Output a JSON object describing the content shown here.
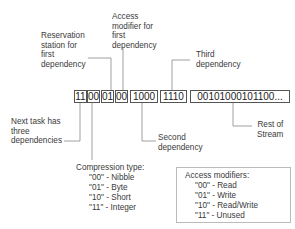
{
  "bitstream": {
    "segments": [
      {
        "bits": "11",
        "meaning": "Next task has three dependencies"
      },
      {
        "bits": "00",
        "meaning": "Compression type"
      },
      {
        "bits": "01",
        "meaning": "Reservation station for first dependency"
      },
      {
        "bits": "00",
        "meaning": "Access modifier for first dependency"
      },
      {
        "bits": "1000",
        "meaning": "Second dependency"
      },
      {
        "bits": "1110",
        "meaning": "Third dependency"
      },
      {
        "bits": "00101000101100...",
        "meaning": "Rest of Stream"
      }
    ]
  },
  "labels": {
    "reservation": [
      "Reservation",
      "station for",
      "first",
      "dependency"
    ],
    "access_modifier": [
      "Access",
      "modifier for",
      "first",
      "dependency"
    ],
    "third": [
      "Third",
      "dependency"
    ],
    "next_task": [
      "Next task has",
      "three",
      "dependencies"
    ],
    "second": [
      "Second",
      "dependency"
    ],
    "rest": [
      "Rest of",
      "Stream"
    ]
  },
  "compression": {
    "title": "Compression type:",
    "items": [
      "\"00\" - Nibble",
      "\"01\" - Byte",
      "\"10\" - Short",
      "\"11\" - Integer"
    ]
  },
  "access_modifiers": {
    "title": "Access modifiers:",
    "items": [
      "\"00\" - Read",
      "\"01\" - Write",
      "\"10\" - Read/Write",
      "\"11\" - Unused"
    ]
  }
}
